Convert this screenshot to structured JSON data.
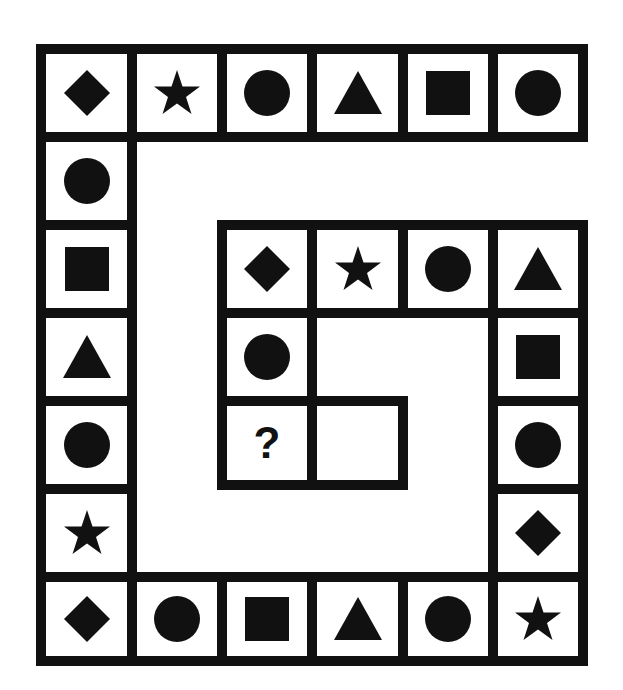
{
  "puzzle": {
    "description": "Spiral sequence of shapes; find the missing shape",
    "border_color": "#111111",
    "fill_color": "#111111",
    "background": "#ffffff",
    "question_mark": "?",
    "outer_top_row": [
      "diamond",
      "star",
      "circle",
      "triangle",
      "square",
      "circle"
    ],
    "outer_left_column": [
      "circle",
      "square",
      "triangle",
      "circle",
      "star"
    ],
    "bottom_row": [
      "diamond",
      "circle",
      "square",
      "triangle",
      "circle",
      "star"
    ],
    "inner_right_column": [
      "triangle",
      "square",
      "circle",
      "diamond"
    ],
    "inner_top_row": [
      "diamond",
      "star",
      "circle",
      "triangle"
    ],
    "inner_left_column": [
      "circle",
      "?"
    ],
    "empty_cell": ""
  },
  "cells": [
    {
      "x": 36,
      "y": 44,
      "w": 101,
      "h": 98,
      "shape": "diamond"
    },
    {
      "x": 127,
      "y": 44,
      "w": 100,
      "h": 98,
      "shape": "star"
    },
    {
      "x": 217,
      "y": 44,
      "w": 100,
      "h": 98,
      "shape": "circle"
    },
    {
      "x": 307,
      "y": 44,
      "w": 101,
      "h": 98,
      "shape": "triangle"
    },
    {
      "x": 398,
      "y": 44,
      "w": 100,
      "h": 98,
      "shape": "square"
    },
    {
      "x": 488,
      "y": 44,
      "w": 100,
      "h": 98,
      "shape": "circle"
    },
    {
      "x": 36,
      "y": 132,
      "w": 101,
      "h": 98,
      "shape": "circle"
    },
    {
      "x": 36,
      "y": 220,
      "w": 101,
      "h": 98,
      "shape": "square"
    },
    {
      "x": 36,
      "y": 308,
      "w": 101,
      "h": 98,
      "shape": "triangle"
    },
    {
      "x": 36,
      "y": 396,
      "w": 101,
      "h": 98,
      "shape": "circle"
    },
    {
      "x": 36,
      "y": 484,
      "w": 101,
      "h": 98,
      "shape": "star"
    },
    {
      "x": 36,
      "y": 572,
      "w": 101,
      "h": 94,
      "shape": "diamond"
    },
    {
      "x": 127,
      "y": 572,
      "w": 100,
      "h": 94,
      "shape": "circle"
    },
    {
      "x": 217,
      "y": 572,
      "w": 100,
      "h": 94,
      "shape": "square"
    },
    {
      "x": 307,
      "y": 572,
      "w": 101,
      "h": 94,
      "shape": "triangle"
    },
    {
      "x": 398,
      "y": 572,
      "w": 100,
      "h": 94,
      "shape": "circle"
    },
    {
      "x": 488,
      "y": 572,
      "w": 100,
      "h": 94,
      "shape": "star"
    },
    {
      "x": 488,
      "y": 220,
      "w": 100,
      "h": 98,
      "shape": "triangle"
    },
    {
      "x": 488,
      "y": 308,
      "w": 100,
      "h": 98,
      "shape": "square"
    },
    {
      "x": 488,
      "y": 396,
      "w": 100,
      "h": 98,
      "shape": "circle"
    },
    {
      "x": 488,
      "y": 484,
      "w": 100,
      "h": 98,
      "shape": "diamond"
    },
    {
      "x": 217,
      "y": 220,
      "w": 100,
      "h": 98,
      "shape": "diamond"
    },
    {
      "x": 307,
      "y": 220,
      "w": 101,
      "h": 98,
      "shape": "star"
    },
    {
      "x": 398,
      "y": 220,
      "w": 100,
      "h": 98,
      "shape": "circle"
    },
    {
      "x": 217,
      "y": 308,
      "w": 100,
      "h": 98,
      "shape": "circle"
    },
    {
      "x": 217,
      "y": 396,
      "w": 100,
      "h": 94,
      "shape": "question"
    },
    {
      "x": 307,
      "y": 396,
      "w": 101,
      "h": 94,
      "shape": "empty"
    }
  ]
}
